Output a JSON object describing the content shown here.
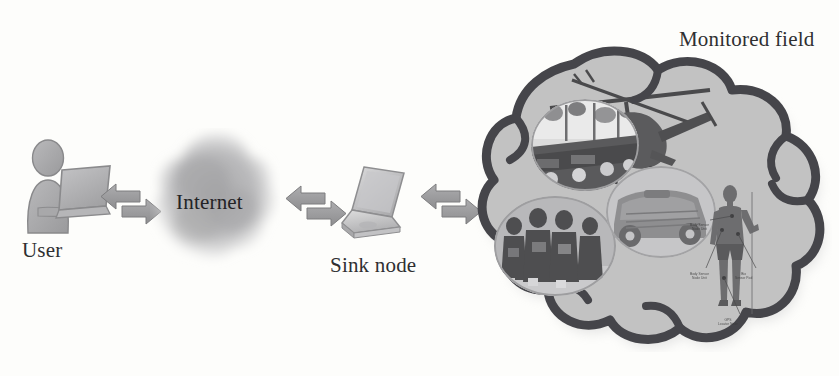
{
  "figure": {
    "domain": "network-architecture-diagram",
    "caption_labels": {
      "user": "User",
      "internet": "Internet",
      "sink_node": "Sink node",
      "monitored_field": "Monitored field"
    }
  },
  "nodes": [
    {
      "id": "user",
      "label": "User",
      "icon": "person-at-laptop-icon"
    },
    {
      "id": "internet",
      "label": "Internet",
      "icon": "cloud-blob-icon"
    },
    {
      "id": "sink",
      "label": "Sink node",
      "icon": "laptop-icon"
    },
    {
      "id": "field",
      "label": "Monitored field",
      "icon": "hand-drawn-cloud-icon"
    }
  ],
  "connectors": [
    {
      "id": "arrow-1",
      "from": "user",
      "to": "internet",
      "style": "bidirectional"
    },
    {
      "id": "arrow-2",
      "from": "internet",
      "to": "sink",
      "style": "bidirectional"
    },
    {
      "id": "arrow-3",
      "from": "sink",
      "to": "field",
      "style": "bidirectional"
    }
  ],
  "monitored_field_contents": [
    {
      "id": "helicopter",
      "name": "attack-helicopter-illustration"
    },
    {
      "id": "convoy",
      "name": "convoy-photo-oval"
    },
    {
      "id": "troops",
      "name": "soldiers-group-photo-oval"
    },
    {
      "id": "vehicle",
      "name": "military-vehicle-photo-oval"
    },
    {
      "id": "soldier",
      "name": "body-worn-sensor-soldier-diagram"
    }
  ],
  "sensor_callouts": [
    "Body Sensor\nNode Unit",
    "Body Sensor\nNode Unit",
    "Bio\nSensor Pod",
    "GPS\nLocator Node"
  ],
  "colors": {
    "page_background": "#fdfdfb",
    "ink": "#2f2f31",
    "arrow_fill": "#9b9b9d",
    "arrow_stroke": "#7c7c7e",
    "cloud_fill": "#c2c2c2",
    "cloud_stroke": "#4a4a4c",
    "blob_fill": "#b9b9bb",
    "figure_fill": "#a9a9ab"
  }
}
